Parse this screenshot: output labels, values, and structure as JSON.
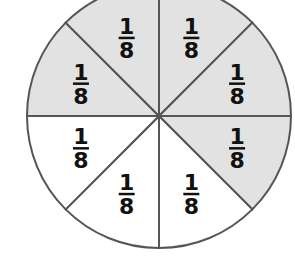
{
  "diagram": {
    "title": "",
    "shape": "circle divided into 8 equal parts",
    "shaded_color": "#e2e2e2",
    "unshaded_color": "#ffffff",
    "line_color": "#555555",
    "sectors": [
      {
        "position": "top-right",
        "numerator": "1",
        "denominator": "8",
        "shaded": true
      },
      {
        "position": "right-upper",
        "numerator": "1",
        "denominator": "8",
        "shaded": true
      },
      {
        "position": "right-lower",
        "numerator": "1",
        "denominator": "8",
        "shaded": true
      },
      {
        "position": "bottom-right",
        "numerator": "1",
        "denominator": "8",
        "shaded": false
      },
      {
        "position": "bottom-left",
        "numerator": "1",
        "denominator": "8",
        "shaded": false
      },
      {
        "position": "left-lower",
        "numerator": "1",
        "denominator": "8",
        "shaded": false
      },
      {
        "position": "left-upper",
        "numerator": "1",
        "denominator": "8",
        "shaded": true
      },
      {
        "position": "top-left",
        "numerator": "1",
        "denominator": "8",
        "shaded": true
      }
    ]
  }
}
